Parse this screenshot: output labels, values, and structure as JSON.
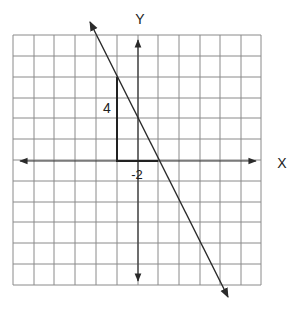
{
  "diagram": {
    "type": "coordinate-plane-slope",
    "axes": {
      "x_label": "X",
      "y_label": "Y"
    },
    "grid": {
      "columns": 12,
      "rows": 12
    },
    "slope_triangle": {
      "rise_label": "4",
      "run_label": "-2"
    },
    "line": {
      "slope": -2,
      "passes_through_grid_units": [
        [
          -1,
          4
        ],
        [
          1,
          0
        ]
      ]
    },
    "colors": {
      "grid": "#8a8a8a",
      "axis": "#333333",
      "line": "#2a2a2a",
      "text": "#222222",
      "background": "#ffffff"
    }
  }
}
